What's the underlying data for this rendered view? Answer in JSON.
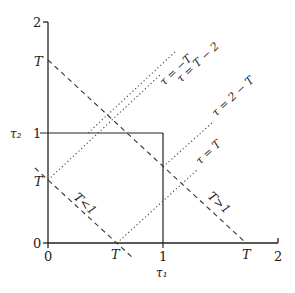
{
  "figure": {
    "type": "diagram",
    "axes": {
      "x_label": "τ₁",
      "y_label": "τ₂",
      "x_ticks": [
        "0",
        "1",
        "2"
      ],
      "y_ticks": [
        "0",
        "1",
        "2"
      ],
      "x_range": [
        0,
        2
      ],
      "y_range": [
        0,
        2
      ]
    },
    "square": {
      "label": "unit square",
      "from": [
        0,
        0
      ],
      "to": [
        1,
        1
      ]
    },
    "axis_marks": {
      "x_T_small": "T",
      "x_T_large": "T",
      "y_T_small": "T",
      "y_T_large": "T"
    },
    "lines": [
      {
        "id": "anti-diag-small",
        "style": "dashed",
        "label": "T < 1",
        "label_plain": "T<1"
      },
      {
        "id": "anti-diag-large",
        "style": "dashed",
        "label": "T > 1",
        "label_plain": "T>1"
      },
      {
        "id": "tau-minus-T",
        "style": "dotted",
        "label": "τ = −T"
      },
      {
        "id": "tau-T-minus-2",
        "style": "dotted",
        "label": "τ = T − 2"
      },
      {
        "id": "tau-2-minus-T",
        "style": "dotted",
        "label": "τ = 2 − T"
      },
      {
        "id": "tau-T",
        "style": "dotted",
        "label": "τ = T"
      }
    ],
    "colors": {
      "ink": "#222222",
      "background": "#ffffff"
    }
  }
}
